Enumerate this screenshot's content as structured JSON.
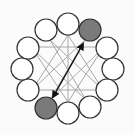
{
  "diagram": {
    "colors": {
      "background": "#fbfbfb",
      "node_fill": "#ffffff",
      "node_highlight_fill": "#7a7a7a",
      "node_stroke": "#333333",
      "chord_stroke": "#a8a8a8",
      "arrow_stroke": "#111111"
    },
    "nodes": [
      {
        "id": "n0",
        "x": 68,
        "y": 24,
        "highlight": false
      },
      {
        "id": "n1",
        "x": 90,
        "y": 30,
        "highlight": true
      },
      {
        "id": "n2",
        "x": 107,
        "y": 48,
        "highlight": false
      },
      {
        "id": "n3",
        "x": 113,
        "y": 69,
        "highlight": false
      },
      {
        "id": "n4",
        "x": 107,
        "y": 90,
        "highlight": false
      },
      {
        "id": "n5",
        "x": 90,
        "y": 107,
        "highlight": false
      },
      {
        "id": "n6",
        "x": 68,
        "y": 113,
        "highlight": false
      },
      {
        "id": "n7",
        "x": 46,
        "y": 108,
        "highlight": true
      },
      {
        "id": "n8",
        "x": 28,
        "y": 90,
        "highlight": false
      },
      {
        "id": "n9",
        "x": 22,
        "y": 69,
        "highlight": false
      },
      {
        "id": "n10",
        "x": 28,
        "y": 48,
        "highlight": false
      },
      {
        "id": "n11",
        "x": 46,
        "y": 30,
        "highlight": false
      }
    ],
    "node_radius": 11,
    "chords": [
      {
        "x1": 39,
        "y1": 47,
        "x2": 96,
        "y2": 47
      },
      {
        "x1": 39,
        "y1": 90,
        "x2": 96,
        "y2": 90
      },
      {
        "x1": 68,
        "y1": 35,
        "x2": 68,
        "y2": 102
      },
      {
        "x1": 50,
        "y1": 40,
        "x2": 103,
        "y2": 90
      },
      {
        "x1": 85,
        "y1": 40,
        "x2": 32,
        "y2": 90
      },
      {
        "x1": 50,
        "y1": 40,
        "x2": 86,
        "y2": 100
      },
      {
        "x1": 85,
        "y1": 40,
        "x2": 50,
        "y2": 100
      },
      {
        "x1": 32,
        "y1": 48,
        "x2": 86,
        "y2": 100
      },
      {
        "x1": 103,
        "y1": 48,
        "x2": 50,
        "y2": 100
      },
      {
        "x1": 32,
        "y1": 48,
        "x2": 68,
        "y2": 102
      },
      {
        "x1": 103,
        "y1": 48,
        "x2": 68,
        "y2": 102
      },
      {
        "x1": 68,
        "y1": 35,
        "x2": 32,
        "y2": 90
      },
      {
        "x1": 68,
        "y1": 35,
        "x2": 103,
        "y2": 90
      }
    ],
    "arrow": {
      "from": "n7",
      "to": "n1",
      "x1": 53,
      "y1": 97,
      "x2": 83,
      "y2": 44,
      "double_headed": true
    }
  }
}
